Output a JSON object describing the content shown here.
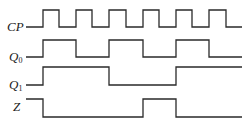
{
  "diagram": {
    "type": "timing-diagram",
    "signals": [
      {
        "name": "CP",
        "label_main": "CP",
        "label_sub": "",
        "high_y": 10,
        "low_y": 27,
        "initial": 0,
        "transitions_x": [
          43,
          59,
          76,
          92,
          109,
          126,
          143,
          159,
          176,
          192,
          209,
          226
        ],
        "start_x": 26,
        "end_x": 242
      },
      {
        "name": "Q0",
        "label_main": "Q",
        "label_sub": "0",
        "high_y": 40,
        "low_y": 57,
        "initial": 0,
        "transitions_x": [
          43,
          76,
          109,
          143,
          176,
          209
        ],
        "start_x": 26,
        "end_x": 242
      },
      {
        "name": "Q1",
        "label_main": "Q",
        "label_sub": "1",
        "high_y": 67,
        "low_y": 85,
        "initial": 0,
        "transitions_x": [
          43,
          109,
          176
        ],
        "start_x": 26,
        "end_x": 242
      },
      {
        "name": "Z",
        "label_main": "Z",
        "label_sub": "",
        "high_y": 99,
        "low_y": 117,
        "initial": 1,
        "transitions_x": [
          43,
          143,
          176
        ],
        "start_x": 26,
        "end_x": 242
      }
    ]
  }
}
